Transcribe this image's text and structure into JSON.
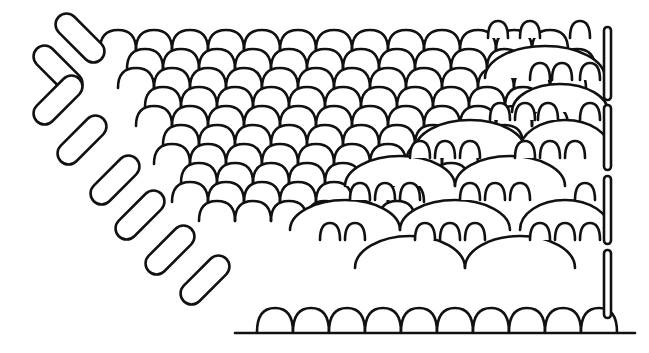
{
  "diagram": {
    "title": "",
    "colors": {
      "line": "#111111",
      "background": "#ffffff"
    },
    "grid": {
      "cols": 12,
      "rows": 10,
      "origin_x": 100,
      "origin_y": 50,
      "cell_w": 36,
      "row_h": 19,
      "arc_r": 19
    },
    "left_loops": [
      {
        "cx": 80,
        "cy": 38,
        "angle": 45
      },
      {
        "cx": 58,
        "cy": 70,
        "angle": 45
      },
      {
        "cx": 58,
        "cy": 100,
        "angle": -45
      },
      {
        "cx": 82,
        "cy": 140,
        "angle": -45
      },
      {
        "cx": 115,
        "cy": 180,
        "angle": -45
      },
      {
        "cx": 140,
        "cy": 215,
        "angle": -45
      },
      {
        "cx": 170,
        "cy": 250,
        "angle": -45
      },
      {
        "cx": 205,
        "cy": 280,
        "angle": -45
      }
    ],
    "big_arcs": [
      {
        "cx": 545,
        "cy": 78,
        "rx": 60,
        "ry": 32
      },
      {
        "cx": 560,
        "cy": 112,
        "rx": 48,
        "ry": 28
      },
      {
        "cx": 470,
        "cy": 150,
        "rx": 55,
        "ry": 30
      },
      {
        "cx": 565,
        "cy": 150,
        "rx": 45,
        "ry": 30
      },
      {
        "cx": 400,
        "cy": 186,
        "rx": 55,
        "ry": 30
      },
      {
        "cx": 510,
        "cy": 186,
        "rx": 55,
        "ry": 30
      },
      {
        "cx": 345,
        "cy": 230,
        "rx": 55,
        "ry": 30
      },
      {
        "cx": 455,
        "cy": 230,
        "rx": 55,
        "ry": 30
      },
      {
        "cx": 565,
        "cy": 230,
        "rx": 45,
        "ry": 30
      },
      {
        "cx": 410,
        "cy": 268,
        "rx": 55,
        "ry": 32
      },
      {
        "cx": 520,
        "cy": 268,
        "rx": 55,
        "ry": 32
      }
    ],
    "small_bumps": [
      {
        "cx": 498,
        "cy": 38
      },
      {
        "cx": 530,
        "cy": 38
      },
      {
        "cx": 580,
        "cy": 38
      },
      {
        "cx": 540,
        "cy": 80
      },
      {
        "cx": 562,
        "cy": 80
      },
      {
        "cx": 590,
        "cy": 80
      },
      {
        "cx": 500,
        "cy": 120
      },
      {
        "cx": 525,
        "cy": 120
      },
      {
        "cx": 548,
        "cy": 120
      },
      {
        "cx": 590,
        "cy": 120
      },
      {
        "cx": 420,
        "cy": 158
      },
      {
        "cx": 445,
        "cy": 158
      },
      {
        "cx": 470,
        "cy": 158
      },
      {
        "cx": 525,
        "cy": 158
      },
      {
        "cx": 550,
        "cy": 158
      },
      {
        "cx": 575,
        "cy": 158
      },
      {
        "cx": 360,
        "cy": 200
      },
      {
        "cx": 385,
        "cy": 200
      },
      {
        "cx": 410,
        "cy": 200
      },
      {
        "cx": 470,
        "cy": 200
      },
      {
        "cx": 495,
        "cy": 200
      },
      {
        "cx": 520,
        "cy": 200
      },
      {
        "cx": 585,
        "cy": 200
      },
      {
        "cx": 330,
        "cy": 240
      },
      {
        "cx": 355,
        "cy": 240
      },
      {
        "cx": 425,
        "cy": 240
      },
      {
        "cx": 450,
        "cy": 240
      },
      {
        "cx": 475,
        "cy": 240
      },
      {
        "cx": 540,
        "cy": 240
      },
      {
        "cx": 565,
        "cy": 240
      },
      {
        "cx": 590,
        "cy": 240
      }
    ],
    "bottom_row": {
      "y": 332,
      "start_x": 257,
      "count": 10,
      "width": 36,
      "height": 24
    },
    "baseline": {
      "x1": 235,
      "x2": 635,
      "y": 333
    },
    "right_bar": {
      "x": 607,
      "segments": [
        {
          "y1": 27,
          "y2": 100
        },
        {
          "y1": 105,
          "y2": 170
        },
        {
          "y1": 176,
          "y2": 244
        },
        {
          "y1": 250,
          "y2": 318
        }
      ]
    }
  }
}
